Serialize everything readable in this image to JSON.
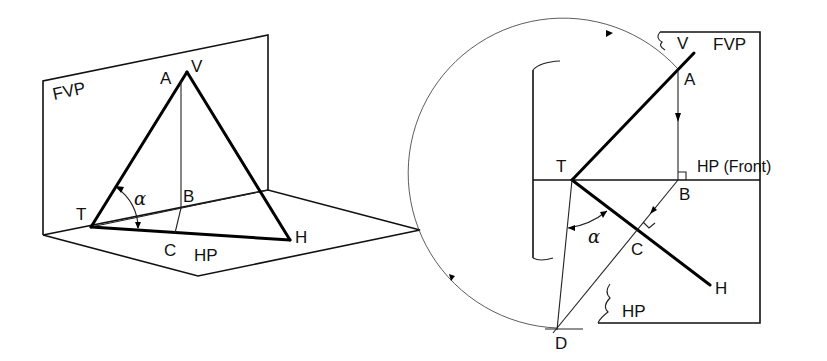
{
  "figure": {
    "left_view": {
      "title": "pictorial",
      "labels": {
        "plane_vertical": "FVP",
        "plane_horizontal": "HP",
        "point_a": "A",
        "point_v": "V",
        "point_t": "T",
        "point_b": "B",
        "point_c": "C",
        "point_h": "H",
        "angle": "α"
      }
    },
    "right_view": {
      "title": "orthographic",
      "labels": {
        "plane_vertical": "FVP",
        "plane_horizontal_front": "HP (Front)",
        "plane_horizontal": "HP",
        "point_v": "V",
        "point_a": "A",
        "point_t": "T",
        "point_b": "B",
        "point_c": "C",
        "point_h": "H",
        "point_d": "D",
        "angle": "α"
      }
    },
    "colors": {
      "line": "#000000",
      "background": "#ffffff"
    }
  }
}
